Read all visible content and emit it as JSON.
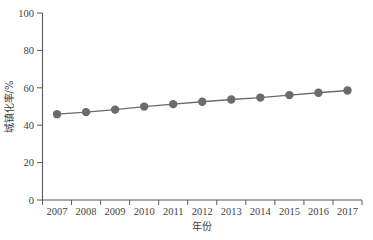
{
  "chart_data": {
    "type": "line",
    "title": "",
    "subtitle": "",
    "xlabel": "年份",
    "ylabel": "城镇化率/%",
    "categories": [
      "2007",
      "2008",
      "2009",
      "2010",
      "2011",
      "2012",
      "2013",
      "2014",
      "2015",
      "2016",
      "2017"
    ],
    "x": [
      2007,
      2008,
      2009,
      2010,
      2011,
      2012,
      2013,
      2014,
      2015,
      2016,
      2017
    ],
    "values": [
      45.9,
      46.99,
      48.34,
      49.95,
      51.27,
      52.57,
      53.73,
      54.77,
      56.1,
      57.35,
      58.52
    ],
    "series": [
      {
        "name": "城镇化率",
        "values": [
          45.9,
          46.99,
          48.34,
          49.95,
          51.27,
          52.57,
          53.73,
          54.77,
          56.1,
          57.35,
          58.52
        ]
      }
    ],
    "xlim": [
      2006.5,
      2017.5
    ],
    "ylim": [
      0,
      100
    ],
    "yticks": [
      0,
      20,
      40,
      60,
      80,
      100
    ],
    "ytick_labels": [
      "0",
      "20",
      "40",
      "60",
      "80",
      "100"
    ],
    "xtick_labels": [
      "2007",
      "2008",
      "2009",
      "2010",
      "2011",
      "2012",
      "2013",
      "2014",
      "2015",
      "2016",
      "2017"
    ],
    "grid": false,
    "legend": false,
    "legend_position": "none",
    "marker": "circle",
    "marker_color": "#6b6b6b",
    "line_color": "#6b6b6b",
    "axis_color": "#5a5a5a",
    "background_color": "#ffffff"
  },
  "axes": {
    "y_axis_title": "城镇化率/%",
    "x_axis_title": "年份"
  }
}
